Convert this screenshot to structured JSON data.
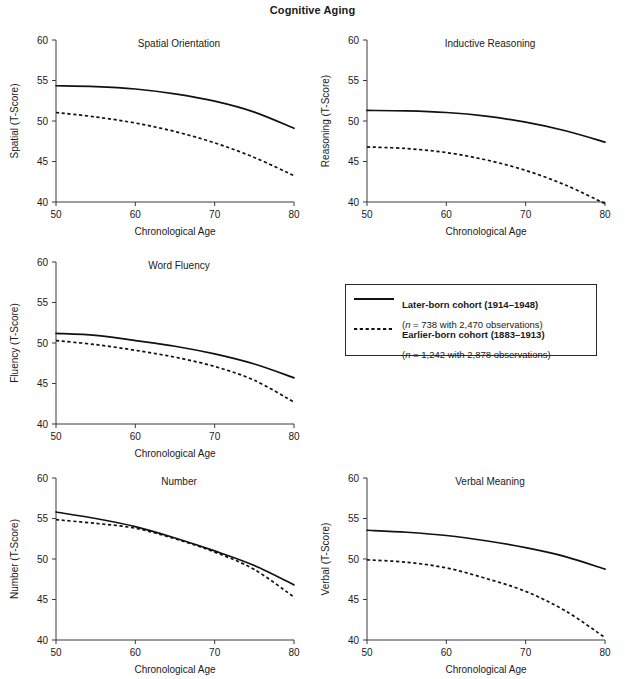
{
  "figure": {
    "title": "Cognitive Aging",
    "x_axis_label": "Chronological Age",
    "caption": ""
  },
  "legend": {
    "items": [
      {
        "style": "solid",
        "label": "Later-born cohort (1914–1948)",
        "sublabel": "(n = 738 with 2,470 observations)",
        "n": 738,
        "observations": 2470,
        "birth_years": "1914–1948"
      },
      {
        "style": "dashed",
        "label": "Earlier-born cohort (1883–1913)",
        "sublabel": "(n = 1,242 with 2,878 observations)",
        "n": 1242,
        "observations": 2878,
        "birth_years": "1883–1913"
      }
    ]
  },
  "panels": [
    {
      "key": "spatial",
      "title": "Spatial Orientation",
      "ylabel": "Spatial (T-Score)",
      "xlabel": "Chronological Age"
    },
    {
      "key": "reasoning",
      "title": "Inductive Reasoning",
      "ylabel": "Reasoning (T-Score)",
      "xlabel": "Chronological Age"
    },
    {
      "key": "fluency",
      "title": "Word Fluency",
      "ylabel": "Fluency (T-Score)",
      "xlabel": "Chronological Age"
    },
    {
      "key": "number",
      "title": "Number",
      "ylabel": "Number (T-Score)",
      "xlabel": "Chronological Age"
    },
    {
      "key": "verbal",
      "title": "Verbal Meaning",
      "ylabel": "Verbal (T-Score)",
      "xlabel": "Chronological Age"
    }
  ],
  "chart_data": [
    {
      "type": "line",
      "key": "spatial",
      "title": "Spatial Orientation",
      "xlabel": "Chronological Age",
      "ylabel": "Spatial (T-Score)",
      "xlim": [
        50,
        80
      ],
      "ylim": [
        40,
        60
      ],
      "xticks": [
        50,
        60,
        70,
        80
      ],
      "yticks": [
        40,
        45,
        50,
        55,
        60
      ],
      "grid": false,
      "legend_position": "external-center-right",
      "x": [
        50,
        55,
        60,
        65,
        70,
        75,
        80
      ],
      "series": [
        {
          "name": "Later-born cohort (1914–1948)",
          "style": "solid",
          "values": [
            54.35,
            54.25,
            53.95,
            53.35,
            52.45,
            51.1,
            49.1
          ]
        },
        {
          "name": "Earlier-born cohort (1883–1913)",
          "style": "dashed",
          "values": [
            51.05,
            50.5,
            49.75,
            48.7,
            47.3,
            45.5,
            43.25
          ]
        }
      ]
    },
    {
      "type": "line",
      "key": "reasoning",
      "title": "Inductive Reasoning",
      "xlabel": "Chronological Age",
      "ylabel": "Reasoning (T-Score)",
      "xlim": [
        50,
        80
      ],
      "ylim": [
        40,
        60
      ],
      "xticks": [
        50,
        60,
        70,
        80
      ],
      "yticks": [
        40,
        45,
        50,
        55,
        60
      ],
      "grid": false,
      "x": [
        50,
        55,
        60,
        65,
        70,
        75,
        80
      ],
      "series": [
        {
          "name": "Later-born cohort (1914–1948)",
          "style": "solid",
          "values": [
            51.3,
            51.25,
            51.05,
            50.6,
            49.85,
            48.8,
            47.4
          ]
        },
        {
          "name": "Earlier-born cohort (1883–1913)",
          "style": "dashed",
          "values": [
            46.8,
            46.6,
            46.1,
            45.2,
            43.9,
            42.1,
            39.8
          ]
        }
      ]
    },
    {
      "type": "line",
      "key": "fluency",
      "title": "Word Fluency",
      "xlabel": "Chronological Age",
      "ylabel": "Fluency (T-Score)",
      "xlim": [
        50,
        80
      ],
      "ylim": [
        40,
        60
      ],
      "xticks": [
        50,
        60,
        70,
        80
      ],
      "yticks": [
        40,
        45,
        50,
        55,
        60
      ],
      "grid": false,
      "x": [
        50,
        55,
        60,
        65,
        70,
        75,
        80
      ],
      "series": [
        {
          "name": "Later-born cohort (1914–1948)",
          "style": "solid",
          "values": [
            51.2,
            50.95,
            50.3,
            49.6,
            48.65,
            47.4,
            45.7
          ]
        },
        {
          "name": "Earlier-born cohort (1883–1913)",
          "style": "dashed",
          "values": [
            50.3,
            49.8,
            49.1,
            48.25,
            47.1,
            45.4,
            42.7
          ]
        }
      ]
    },
    {
      "type": "line",
      "key": "number",
      "title": "Number",
      "xlabel": "Chronological Age",
      "ylabel": "Number (T-Score)",
      "xlim": [
        40,
        60
      ],
      "ylim": [
        40,
        60
      ],
      "xticks": [
        50,
        60,
        70,
        80
      ],
      "yticks": [
        40,
        45,
        50,
        55,
        60
      ],
      "grid": false,
      "x": [
        50,
        55,
        60,
        65,
        70,
        75,
        80
      ],
      "series": [
        {
          "name": "Later-born cohort (1914–1948)",
          "style": "solid",
          "values": [
            55.8,
            55.0,
            54.0,
            52.6,
            51.0,
            49.2,
            46.8
          ]
        },
        {
          "name": "Earlier-born cohort (1883–1913)",
          "style": "dashed",
          "values": [
            54.85,
            54.4,
            53.8,
            52.5,
            50.85,
            48.7,
            45.3
          ]
        }
      ]
    },
    {
      "type": "line",
      "key": "verbal",
      "title": "Verbal Meaning",
      "xlabel": "Chronological Age",
      "ylabel": "Verbal (T-Score)",
      "xlim": [
        50,
        80
      ],
      "ylim": [
        40,
        60
      ],
      "xticks": [
        50,
        60,
        70,
        80
      ],
      "yticks": [
        40,
        45,
        50,
        55,
        60
      ],
      "grid": false,
      "x": [
        50,
        55,
        60,
        65,
        70,
        75,
        80
      ],
      "series": [
        {
          "name": "Later-born cohort (1914–1948)",
          "style": "solid",
          "values": [
            53.55,
            53.3,
            52.9,
            52.25,
            51.4,
            50.3,
            48.75
          ]
        },
        {
          "name": "Earlier-born cohort (1883–1913)",
          "style": "dashed",
          "values": [
            49.9,
            49.6,
            48.9,
            47.6,
            46.0,
            43.6,
            40.3
          ]
        }
      ]
    }
  ]
}
